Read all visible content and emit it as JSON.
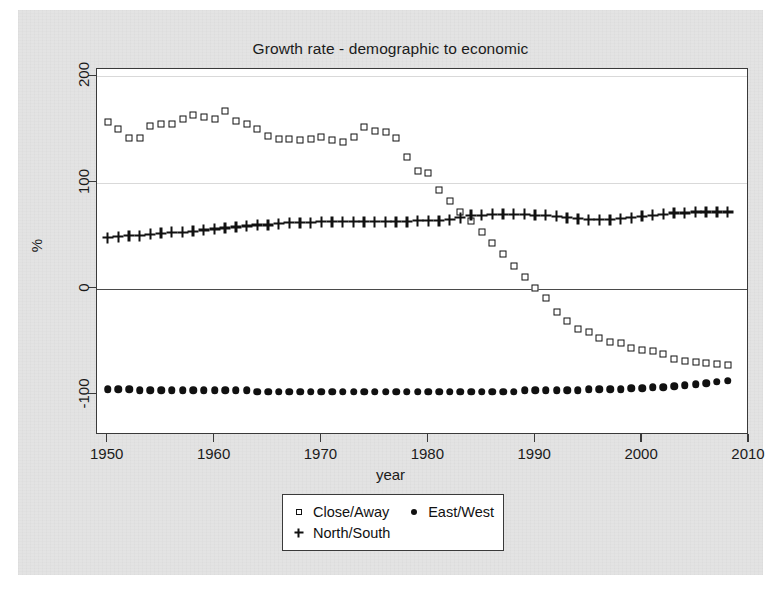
{
  "chart_data": {
    "type": "scatter",
    "title": "Growth rate - demographic to economic",
    "xlabel": "year",
    "ylabel": "%",
    "xlim": [
      1949,
      2010
    ],
    "ylim": [
      -138,
      207
    ],
    "xticks": [
      1950,
      1960,
      1970,
      1980,
      1990,
      2000,
      2010
    ],
    "yticks": [
      200,
      100,
      0,
      -100
    ],
    "grid": true,
    "gridlines_at": [
      200,
      100
    ],
    "zero_line": 0,
    "legend_position": "below-center",
    "x": [
      1950,
      1951,
      1952,
      1953,
      1954,
      1955,
      1956,
      1957,
      1958,
      1959,
      1960,
      1961,
      1962,
      1963,
      1964,
      1965,
      1966,
      1967,
      1968,
      1969,
      1970,
      1971,
      1972,
      1973,
      1974,
      1975,
      1976,
      1977,
      1978,
      1979,
      1980,
      1981,
      1982,
      1983,
      1984,
      1985,
      1986,
      1987,
      1988,
      1989,
      1990,
      1991,
      1992,
      1993,
      1994,
      1995,
      1996,
      1997,
      1998,
      1999,
      2000,
      2001,
      2002,
      2003,
      2004,
      2005,
      2006,
      2007,
      2008
    ],
    "series": [
      {
        "name": "Close/Away",
        "marker": "open-square",
        "color": "#111111",
        "values": [
          157,
          150,
          142,
          142,
          153,
          155,
          155,
          160,
          164,
          162,
          160,
          167,
          158,
          155,
          150,
          144,
          141,
          141,
          140,
          141,
          143,
          140,
          138,
          143,
          152,
          149,
          148,
          142,
          124,
          111,
          109,
          93,
          83,
          72,
          64,
          53,
          43,
          33,
          21,
          11,
          1,
          -9,
          -22,
          -31,
          -38,
          -41,
          -47,
          -50,
          -51,
          -56,
          -58,
          -59,
          -62,
          -66,
          -68,
          -69,
          -70,
          -71,
          -72
        ]
      },
      {
        "name": "East/West",
        "marker": "filled-circle",
        "color": "#111111",
        "values": [
          -95,
          -95,
          -95,
          -96,
          -96,
          -96,
          -96,
          -96,
          -96,
          -96,
          -96,
          -96,
          -96,
          -96,
          -97,
          -97,
          -97,
          -97,
          -97,
          -97,
          -97,
          -97,
          -97,
          -97,
          -97,
          -97,
          -97,
          -97,
          -97,
          -97,
          -97,
          -97,
          -97,
          -97,
          -97,
          -97,
          -97,
          -97,
          -97,
          -96,
          -96,
          -96,
          -96,
          -96,
          -96,
          -95,
          -95,
          -95,
          -95,
          -94,
          -94,
          -93,
          -93,
          -92,
          -91,
          -90,
          -89,
          -88,
          -87
        ]
      },
      {
        "name": "North/South",
        "marker": "plus",
        "color": "#111111",
        "values": [
          48,
          49,
          50,
          50,
          51,
          52,
          53,
          53,
          54,
          55,
          56,
          57,
          58,
          59,
          60,
          60,
          61,
          62,
          62,
          62,
          63,
          63,
          63,
          63,
          63,
          63,
          63,
          63,
          63,
          64,
          64,
          64,
          65,
          67,
          69,
          69,
          70,
          70,
          70,
          70,
          69,
          69,
          68,
          67,
          66,
          65,
          65,
          65,
          66,
          67,
          68,
          69,
          70,
          71,
          71,
          72,
          72,
          72,
          72
        ]
      }
    ]
  },
  "legend": {
    "entries": [
      {
        "label": "Close/Away",
        "marker": "open-square"
      },
      {
        "label": "East/West",
        "marker": "filled-circle"
      },
      {
        "label": "North/South",
        "marker": "plus"
      }
    ]
  }
}
